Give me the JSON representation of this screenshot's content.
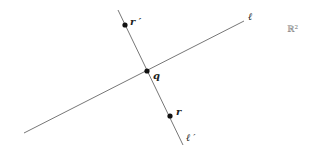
{
  "diagram": {
    "space_label": "ℝ²",
    "lines": [
      {
        "name": "ℓ",
        "label": "ℓ",
        "x1": 24,
        "y1": 133,
        "x2": 244,
        "y2": 21
      },
      {
        "name": "ℓ′",
        "label": "ℓ ′",
        "x1": 118,
        "y1": 10,
        "x2": 183,
        "y2": 145
      }
    ],
    "points": [
      {
        "label": "q",
        "x": 147,
        "y": 71
      },
      {
        "label": "r ′",
        "x": 125,
        "y": 25
      },
      {
        "label": "r",
        "x": 170,
        "y": 116
      }
    ],
    "colors": {
      "line": "#777777",
      "point": "#111111"
    }
  }
}
